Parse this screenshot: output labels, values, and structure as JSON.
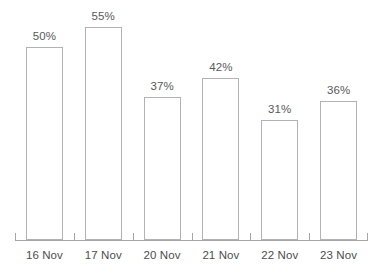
{
  "chart_data": {
    "type": "bar",
    "title": "",
    "subtitle": "",
    "xlabel": "",
    "ylabel": "",
    "categories": [
      "16 Nov",
      "17 Nov",
      "20 Nov",
      "21 Nov",
      "22 Nov",
      "23 Nov"
    ],
    "values": [
      50,
      55,
      37,
      42,
      31,
      36
    ],
    "data_labels": [
      "50%",
      "55%",
      "37%",
      "42%",
      "31%",
      "36%"
    ],
    "ylim": [
      0,
      60
    ],
    "grid": false,
    "legend": null,
    "unit": "%",
    "bar_style": {
      "fill": "#ffffff",
      "border": "#b2b2b2"
    },
    "axis_color": "#a6a6a6",
    "label_color": "#595959",
    "category_color": "#4d4d4d"
  }
}
